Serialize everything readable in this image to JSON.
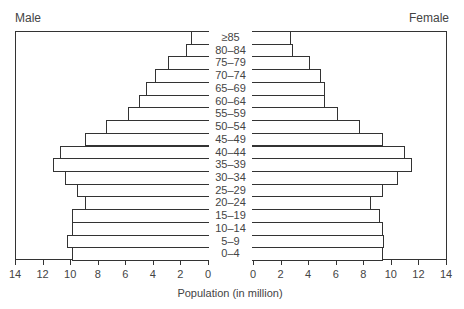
{
  "chart_data": {
    "type": "bar",
    "subtype": "population-pyramid",
    "title": "",
    "xlabel": "Population (in million)",
    "ylabel": "",
    "categories": [
      "≥85",
      "80–84",
      "75–79",
      "70–74",
      "65–69",
      "60–64",
      "55–59",
      "50–54",
      "45–49",
      "40–44",
      "35–39",
      "30–34",
      "25–29",
      "20–24",
      "15–19",
      "10–14",
      "5–9",
      "0–4"
    ],
    "series": [
      {
        "name": "Male",
        "values": [
          1.3,
          1.7,
          3.0,
          3.9,
          4.6,
          5.1,
          5.9,
          7.5,
          9.0,
          10.8,
          11.3,
          10.4,
          9.6,
          9.0,
          9.9,
          9.9,
          10.3,
          9.9
        ]
      },
      {
        "name": "Female",
        "values": [
          2.8,
          3.0,
          4.2,
          5.0,
          5.3,
          5.3,
          6.2,
          7.8,
          9.5,
          11.1,
          11.6,
          10.6,
          9.5,
          8.6,
          9.3,
          9.5,
          9.6,
          9.5
        ]
      }
    ],
    "xlim": [
      0,
      14
    ],
    "x_ticks": [
      0,
      2,
      4,
      6,
      8,
      10,
      12,
      14
    ],
    "grid": false,
    "legend": "panel titles: Male (top-left), Female (top-right)"
  },
  "labels": {
    "male": "Male",
    "female": "Female",
    "xlabel": "Population (in million)",
    "left_ticks": [
      "14",
      "12",
      "10",
      "8",
      "6",
      "4",
      "2",
      "0"
    ],
    "right_ticks": [
      "0",
      "2",
      "4",
      "6",
      "8",
      "10",
      "12",
      "14"
    ]
  }
}
